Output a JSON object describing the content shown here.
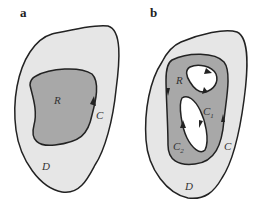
{
  "panels": [
    {
      "label": "a",
      "region_label": "R",
      "curve_label": "C",
      "domain_label": "D"
    },
    {
      "label": "b",
      "region_label": "R",
      "curve_label": "C",
      "domain_label": "D",
      "hole_curves": [
        {
          "label": "C",
          "subscript": "1"
        },
        {
          "label": "C",
          "subscript": "2"
        }
      ]
    }
  ],
  "colors": {
    "domain_fill": "#e6e6e6",
    "region_fill": "#a8a8a8",
    "hole_fill": "#ffffff",
    "stroke": "#222222"
  }
}
